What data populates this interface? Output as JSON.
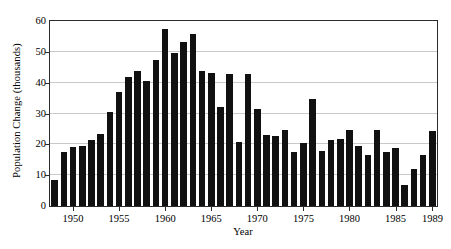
{
  "chart_data": {
    "type": "bar",
    "title": "",
    "xlabel": "Year",
    "ylabel": "Population Change (thousands)",
    "ylim": [
      0,
      60
    ],
    "yticks": [
      0,
      10,
      20,
      30,
      40,
      50,
      60
    ],
    "xtick_labels": [
      "1950",
      "1955",
      "1960",
      "1965",
      "1970",
      "1975",
      "1980",
      "1985",
      "1989"
    ],
    "xtick_years": [
      1950,
      1955,
      1960,
      1965,
      1970,
      1975,
      1980,
      1985,
      1989
    ],
    "grid": "horizontal",
    "legend": "none",
    "bar_color": "#111111",
    "categories": [
      "1948",
      "1949",
      "1950",
      "1951",
      "1952",
      "1953",
      "1954",
      "1955",
      "1956",
      "1957",
      "1958",
      "1959",
      "1960",
      "1961",
      "1962",
      "1963",
      "1964",
      "1965",
      "1966",
      "1967",
      "1968",
      "1969",
      "1970",
      "1971",
      "1972",
      "1973",
      "1974",
      "1975",
      "1976",
      "1977",
      "1978",
      "1979",
      "1980",
      "1981",
      "1982",
      "1983",
      "1984",
      "1985",
      "1986",
      "1987",
      "1988",
      "1989"
    ],
    "values": [
      8.4,
      17.6,
      19.3,
      19.5,
      21.5,
      23.3,
      30.5,
      37.1,
      42.0,
      43.7,
      40.6,
      47.5,
      57.4,
      49.7,
      53.2,
      55.9,
      43.7,
      43.2,
      32.2,
      42.8,
      20.9,
      42.7,
      31.6,
      23.1,
      22.7,
      24.8,
      17.5,
      20.5,
      34.7,
      18.0,
      21.3,
      21.8,
      24.6,
      19.5,
      16.5,
      24.7,
      17.5,
      18.8,
      6.8,
      12.1,
      16.5,
      24.4
    ]
  },
  "axes": {
    "x_start_year": 1948,
    "x_end_year": 1989
  }
}
